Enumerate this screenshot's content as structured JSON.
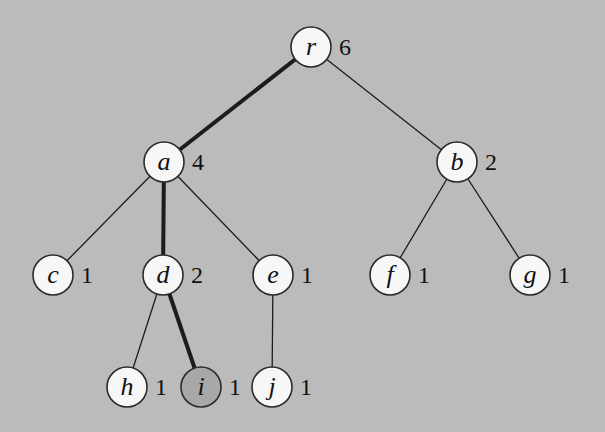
{
  "diagram": {
    "type": "tree",
    "radius": 20,
    "colors": {
      "background": "#bbbbbb",
      "node_fill": "#f7f7f7",
      "node_fill_highlight": "#a8a8a8",
      "stroke": "#1c1c1c"
    },
    "nodes": [
      {
        "id": "r",
        "label": "r",
        "size": "6",
        "x": 311,
        "y": 47,
        "shaded": false
      },
      {
        "id": "a",
        "label": "a",
        "size": "4",
        "x": 164,
        "y": 162,
        "shaded": false
      },
      {
        "id": "b",
        "label": "b",
        "size": "2",
        "x": 457,
        "y": 162,
        "shaded": false
      },
      {
        "id": "c",
        "label": "c",
        "size": "1",
        "x": 53,
        "y": 275,
        "shaded": false
      },
      {
        "id": "d",
        "label": "d",
        "size": "2",
        "x": 163,
        "y": 275,
        "shaded": false
      },
      {
        "id": "e",
        "label": "e",
        "size": "1",
        "x": 273,
        "y": 275,
        "shaded": false
      },
      {
        "id": "f",
        "label": "f",
        "size": "1",
        "x": 390,
        "y": 275,
        "shaded": false
      },
      {
        "id": "g",
        "label": "g",
        "size": "1",
        "x": 530,
        "y": 275,
        "shaded": false
      },
      {
        "id": "h",
        "label": "h",
        "size": "1",
        "x": 127,
        "y": 387,
        "shaded": false
      },
      {
        "id": "i",
        "label": "i",
        "size": "1",
        "x": 201,
        "y": 387,
        "shaded": true
      },
      {
        "id": "j",
        "label": "j",
        "size": "1",
        "x": 272,
        "y": 387,
        "shaded": false
      }
    ],
    "edges": [
      {
        "from": "r",
        "to": "a",
        "highlight": true
      },
      {
        "from": "r",
        "to": "b",
        "highlight": false
      },
      {
        "from": "a",
        "to": "c",
        "highlight": false
      },
      {
        "from": "a",
        "to": "d",
        "highlight": true
      },
      {
        "from": "a",
        "to": "e",
        "highlight": false
      },
      {
        "from": "b",
        "to": "f",
        "highlight": false
      },
      {
        "from": "b",
        "to": "g",
        "highlight": false
      },
      {
        "from": "d",
        "to": "h",
        "highlight": false
      },
      {
        "from": "d",
        "to": "i",
        "highlight": true
      },
      {
        "from": "e",
        "to": "j",
        "highlight": false
      }
    ]
  }
}
